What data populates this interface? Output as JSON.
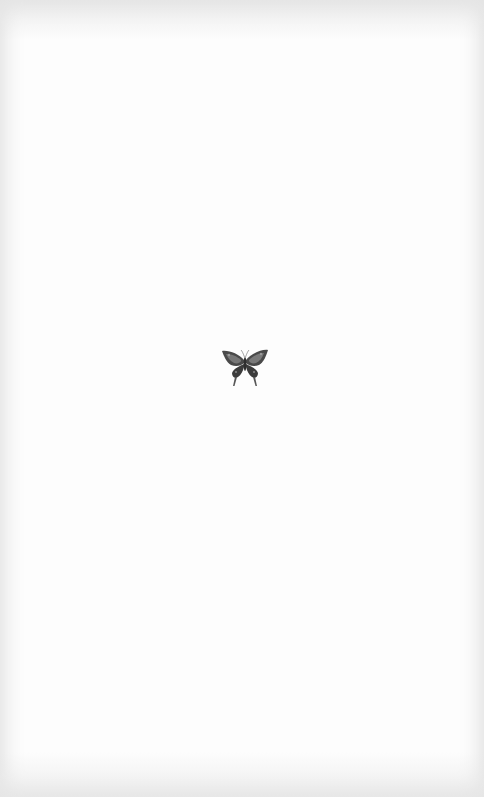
{
  "image": {
    "description": "Small gray butterfly illustration centered on textured white paper",
    "background_color": "#fdfdfd",
    "edge_shade_color": "#e2e2e2",
    "subject": {
      "icon": "butterfly-icon",
      "wing_color_dark": "#3c3c3c",
      "wing_color_mid": "#6e6e6e",
      "wing_color_light": "#9a9a9a"
    }
  }
}
